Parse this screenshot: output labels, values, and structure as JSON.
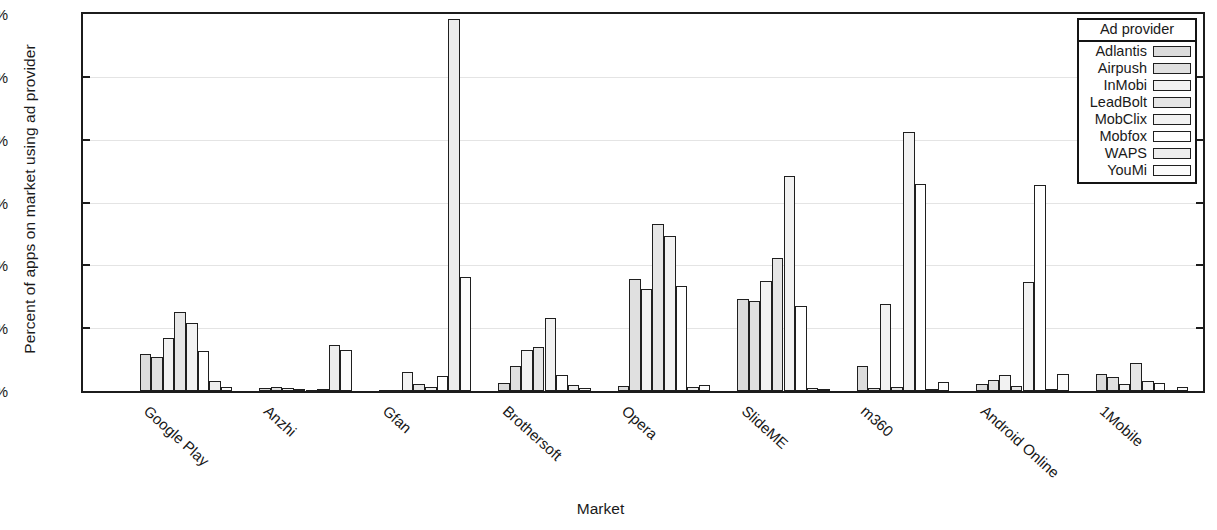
{
  "chart_data": {
    "type": "bar",
    "title": "",
    "xlabel": "Market",
    "ylabel": "Percent of apps on market using ad provider",
    "ylim": [
      0,
      12
    ],
    "ytick_labels": [
      "0%",
      "2%",
      "4%",
      "6%",
      "8%",
      "10%",
      "12%"
    ],
    "ytick_values": [
      0,
      2,
      4,
      6,
      8,
      10,
      12
    ],
    "grid": true,
    "grid_axis": "y",
    "legend_title": "Ad provider",
    "legend_position": "top-right inside",
    "categories": [
      "Google Play",
      "Anzhi",
      "Gfan",
      "Brothersoft",
      "Opera",
      "SlideME",
      "m360",
      "Android Online",
      "1Mobile"
    ],
    "series": [
      {
        "name": "Adlantis",
        "color": "#dcdcdc",
        "values": [
          1.18,
          0.1,
          0.03,
          0.25,
          0.17,
          2.92,
          0.8,
          0.22,
          0.55
        ]
      },
      {
        "name": "Airpush",
        "color": "#e0e0e0",
        "values": [
          1.08,
          0.12,
          0.02,
          0.78,
          3.57,
          2.88,
          0.1,
          0.35,
          0.45
        ]
      },
      {
        "name": "InMobi",
        "color": "#f2f2f2",
        "values": [
          1.7,
          0.11,
          0.62,
          1.32,
          3.25,
          3.5,
          2.77,
          0.5,
          0.22
        ]
      },
      {
        "name": "LeadBolt",
        "color": "#e6e6e6",
        "values": [
          2.5,
          0.05,
          0.21,
          1.4,
          5.33,
          4.22,
          0.13,
          0.15,
          0.9
        ]
      },
      {
        "name": "MobClix",
        "color": "#f2f2f2",
        "values": [
          2.17,
          0.04,
          0.12,
          2.33,
          4.92,
          6.83,
          8.24,
          3.48,
          0.32
        ]
      },
      {
        "name": "Mobfox",
        "color": "#ffffff",
        "values": [
          1.28,
          0.06,
          0.47,
          0.52,
          3.35,
          2.7,
          6.6,
          6.55,
          0.25
        ]
      },
      {
        "name": "WAPS",
        "color": "#ededed",
        "values": [
          0.33,
          1.45,
          11.85,
          0.18,
          0.13,
          0.1,
          0.06,
          0.06,
          0.04
        ]
      },
      {
        "name": "YouMi",
        "color": "#fbfbfb",
        "values": [
          0.13,
          1.3,
          3.63,
          0.09,
          0.2,
          0.05,
          0.3,
          0.55,
          0.13
        ]
      }
    ]
  }
}
